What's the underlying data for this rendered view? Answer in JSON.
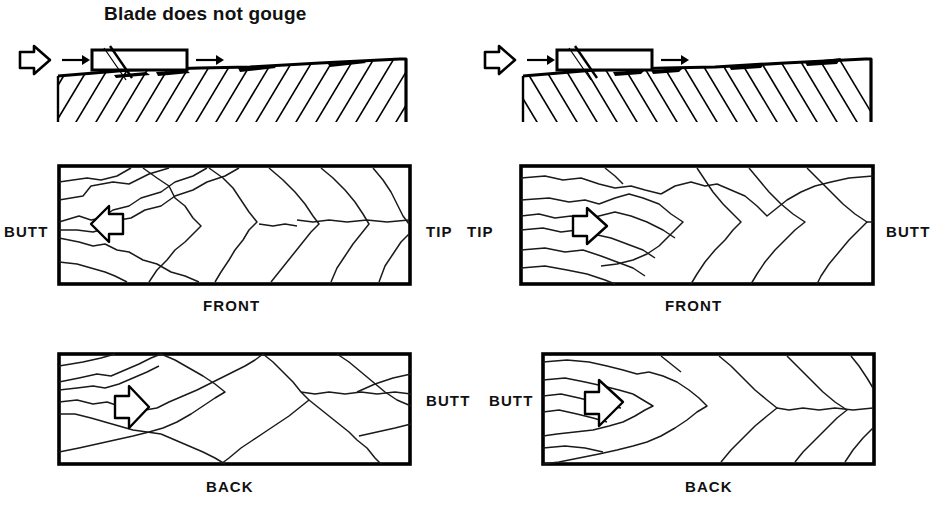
{
  "figure": {
    "caption_left": "Blade does not gouge"
  },
  "columns": [
    {
      "id": "left",
      "edge_view": {
        "title": "Blade does not gouge",
        "push_arrow": "large-arrow-right",
        "motion_arrows": [
          "arrow-right",
          "arrow-right"
        ],
        "blade": "blade-rectangle-with-diagonal",
        "hatch_direction": "up-right",
        "fiber_direction": "with-grain",
        "fibers_raised": 4
      },
      "front_panel": {
        "face_label": "FRONT",
        "left_end_label": "BUTT",
        "right_end_label": "TIP",
        "arrow": "arrow-left",
        "grain_apex": "left"
      },
      "back_panel": {
        "face_label": "BACK",
        "left_end_label": "",
        "right_end_label": "BUTT",
        "arrow": "arrow-right",
        "grain_apex": "left"
      }
    },
    {
      "id": "right",
      "edge_view": {
        "title": "",
        "push_arrow": "large-arrow-right",
        "motion_arrows": [
          "arrow-right",
          "arrow-right"
        ],
        "blade": "blade-rectangle-with-diagonal",
        "hatch_direction": "down-right",
        "fiber_direction": "against-grain",
        "fibers_raised": 4
      },
      "front_panel": {
        "face_label": "FRONT",
        "left_end_label": "TIP",
        "right_end_label": "BUTT",
        "arrow": "arrow-right",
        "grain_apex": "left"
      },
      "back_panel": {
        "face_label": "BACK",
        "left_end_label": "BUTT",
        "right_end_label": "",
        "arrow": "arrow-right",
        "grain_apex": "left"
      }
    }
  ],
  "colors": {
    "ink": "#000000",
    "paper": "#ffffff",
    "grain_line": "#1a1a1a"
  }
}
